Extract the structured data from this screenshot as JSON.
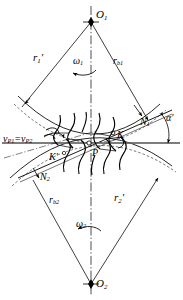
{
  "figure": {
    "type": "involute-gear-meshing-diagram",
    "ink_color": "#000000",
    "background_color": "#ffffff",
    "axis_line_style": "dash-dot"
  },
  "centers": {
    "top": {
      "label": "O",
      "subscript": "1",
      "x": 91,
      "y": 22
    },
    "bottom": {
      "label": "O",
      "subscript": "2",
      "x": 91,
      "y": 284
    }
  },
  "radii": {
    "pitch_upper": {
      "label": "r",
      "subscript": "1",
      "prime": true
    },
    "base_upper": {
      "label": "r",
      "subscript": "b1",
      "prime": false
    },
    "base_lower": {
      "label": "r",
      "subscript": "b2",
      "prime": false
    },
    "pitch_lower": {
      "label": "r",
      "subscript": "2",
      "prime": true
    }
  },
  "angular_velocities": {
    "upper": {
      "label": "ω",
      "subscript": "1",
      "direction": "counterclockwise"
    },
    "lower": {
      "label": "ω",
      "subscript": "2",
      "direction": "counterclockwise"
    }
  },
  "points": {
    "pitch_point": {
      "label": "P"
    },
    "contact_upper": {
      "label": "K",
      "prime": false
    },
    "contact_lower": {
      "label": "K",
      "prime": true
    },
    "tangency_upper": {
      "label": "N",
      "subscript": "1"
    },
    "tangency_lower": {
      "label": "N",
      "subscript": "2"
    }
  },
  "angles": {
    "pressure_angle": {
      "label": "α",
      "prime": true
    }
  },
  "velocity": {
    "equality_label": "v_P1 = v_P2",
    "left_symbol": "v",
    "left_subscript": "P1",
    "equals": "=",
    "right_symbol": "v",
    "right_subscript": "P2"
  }
}
